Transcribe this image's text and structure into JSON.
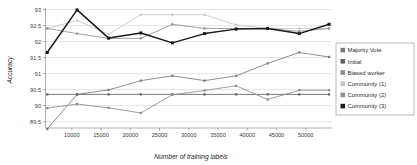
{
  "chart_data": {
    "type": "line",
    "title": "",
    "xlabel": "Number of training labels",
    "ylabel": "Accuracy",
    "xlim": [
      5500,
      54500
    ],
    "ylim": [
      89.3,
      93.05
    ],
    "xticks": [
      10000,
      15000,
      20000,
      25000,
      30000,
      35000,
      40000,
      45000,
      50000
    ],
    "yticks": [
      89.5,
      90,
      90.5,
      91,
      91.5,
      92,
      92.5,
      93
    ],
    "ytick_labels": [
      "89.5",
      "90",
      "90.5",
      "91",
      "91.5",
      "92",
      "92.5",
      "93"
    ],
    "xtick_labels": [
      "10000",
      "15000",
      "20000",
      "25000",
      "30000",
      "35000",
      "40000",
      "45000",
      "50000"
    ],
    "grid": true,
    "legend_position": "right",
    "x": [
      5800,
      10900,
      16300,
      21800,
      27200,
      32700,
      38100,
      43500,
      48900,
      54000
    ],
    "series": [
      {
        "name": "Majority Vote",
        "color": "#7a7a7a",
        "values": [
          89.27,
          90.35,
          90.49,
          90.78,
          90.93,
          90.78,
          90.93,
          91.32,
          91.66,
          91.52
        ]
      },
      {
        "name": "Initial",
        "color": "#606060",
        "values": [
          90.35,
          90.35,
          90.35,
          90.35,
          90.35,
          90.35,
          90.35,
          90.35,
          90.35,
          90.35
        ]
      },
      {
        "name": "Biased worker",
        "color": "#8c8c8c",
        "values": [
          89.92,
          90.05,
          89.93,
          89.77,
          90.34,
          90.47,
          90.62,
          90.19,
          90.48,
          90.48
        ]
      },
      {
        "name": "Community (1)",
        "color": "#c6c6c6",
        "values": [
          92.41,
          92.66,
          92.23,
          92.84,
          92.84,
          92.84,
          92.52,
          92.41,
          92.41,
          92.41
        ]
      },
      {
        "name": "Community (2)",
        "color": "#8f8f8f",
        "values": [
          92.41,
          92.25,
          92.1,
          92.1,
          92.54,
          92.41,
          92.41,
          92.41,
          92.32,
          92.41
        ]
      },
      {
        "name": "Community (3)",
        "color": "#1a1a1a",
        "values": [
          91.66,
          92.99,
          92.11,
          92.27,
          91.96,
          92.25,
          92.39,
          92.41,
          92.25,
          92.54
        ]
      }
    ]
  },
  "legend": {
    "items": [
      {
        "label": "Majority Vote",
        "swatch": "#7a7a7a"
      },
      {
        "label": "Initial",
        "swatch": "#606060"
      },
      {
        "label": "Biased worker",
        "swatch": "#8c8c8c"
      },
      {
        "label": "Community (1)",
        "swatch": "#c6c6c6"
      },
      {
        "label": "Community (2)",
        "swatch": "#8f8f8f"
      },
      {
        "label": "Community (3)",
        "swatch": "#1a1a1a"
      }
    ]
  },
  "axes": {
    "x_title": "Number of training labels",
    "y_title": "Accuracy"
  }
}
